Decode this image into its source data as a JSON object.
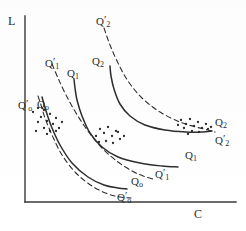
{
  "figure": {
    "axes": {
      "y_label": "L",
      "x_label": "C",
      "origin": [
        25,
        202
      ],
      "y_top": 16,
      "x_right": 236
    },
    "labels": [
      {
        "id": "q2-prime-top",
        "base": "Q",
        "sub": "2",
        "prime": true,
        "x": 96,
        "y": 14
      },
      {
        "id": "q1-prime-left",
        "base": "Q",
        "sub": "1",
        "prime": true,
        "x": 45,
        "y": 56
      },
      {
        "id": "q1-left",
        "base": "Q",
        "sub": "1",
        "prime": false,
        "x": 67,
        "y": 68
      },
      {
        "id": "q2-left",
        "base": "Q",
        "sub": "2",
        "prime": false,
        "x": 92,
        "y": 56
      },
      {
        "id": "q0-prime-axis",
        "base": "Q",
        "sub": "o",
        "prime": true,
        "x": 18,
        "y": 98
      },
      {
        "id": "q0-axis",
        "base": "Q",
        "sub": "o",
        "prime": false,
        "x": 37,
        "y": 99
      },
      {
        "id": "q2-right",
        "base": "Q",
        "sub": "2",
        "prime": false,
        "x": 215,
        "y": 117
      },
      {
        "id": "q2-prime-right",
        "base": "Q",
        "sub": "2",
        "prime": true,
        "x": 215,
        "y": 133
      },
      {
        "id": "q1-right",
        "base": "Q",
        "sub": "1",
        "prime": false,
        "x": 185,
        "y": 150
      },
      {
        "id": "q1-prime-right",
        "base": "Q",
        "sub": "1",
        "prime": true,
        "x": 155,
        "y": 167
      },
      {
        "id": "q0-right",
        "base": "Q",
        "sub": "o",
        "prime": false,
        "x": 131,
        "y": 176
      },
      {
        "id": "q0-prime-bottom",
        "base": "Q",
        "sub": "o",
        "prime": true,
        "x": 117,
        "y": 190
      }
    ]
  },
  "chart_data": {
    "type": "line",
    "title": "",
    "xlabel": "C",
    "ylabel": "L",
    "grid": false,
    "legend": "none",
    "note": "Family of convex downward-sloping iso-curves; solid = Q-curves, dashed = Q-prime curves; scattered dots are observed data points.",
    "series": [
      {
        "name": "Qo",
        "style": "solid",
        "points": [
          [
            42,
            97
          ],
          [
            44,
            104
          ],
          [
            47,
            114
          ],
          [
            52,
            128
          ],
          [
            60,
            145
          ],
          [
            72,
            163
          ],
          [
            88,
            177
          ],
          [
            104,
            185
          ],
          [
            118,
            188
          ],
          [
            127,
            189
          ]
        ]
      },
      {
        "name": "Qo'",
        "style": "dashed",
        "points": [
          [
            38,
            96
          ],
          [
            41,
            105
          ],
          [
            45,
            118
          ],
          [
            52,
            135
          ],
          [
            62,
            155
          ],
          [
            76,
            173
          ],
          [
            92,
            186
          ],
          [
            108,
            194
          ],
          [
            120,
            197
          ],
          [
            131,
            198
          ]
        ]
      },
      {
        "name": "Q1",
        "style": "solid",
        "points": [
          [
            74,
            79
          ],
          [
            75,
            88
          ],
          [
            77,
            100
          ],
          [
            82,
            116
          ],
          [
            90,
            133
          ],
          [
            102,
            147
          ],
          [
            118,
            157
          ],
          [
            140,
            163
          ],
          [
            162,
            166
          ],
          [
            178,
            167
          ]
        ]
      },
      {
        "name": "Q1'",
        "style": "dashed",
        "points": [
          [
            52,
            64
          ],
          [
            58,
            78
          ],
          [
            66,
            95
          ],
          [
            76,
            113
          ],
          [
            88,
            131
          ],
          [
            102,
            148
          ],
          [
            118,
            162
          ],
          [
            134,
            172
          ],
          [
            146,
            177
          ],
          [
            153,
            179
          ]
        ]
      },
      {
        "name": "Q2",
        "style": "solid",
        "points": [
          [
            110,
            66
          ],
          [
            111,
            76
          ],
          [
            114,
            89
          ],
          [
            120,
            104
          ],
          [
            130,
            116
          ],
          [
            145,
            125
          ],
          [
            165,
            130
          ],
          [
            186,
            132
          ],
          [
            202,
            132
          ],
          [
            212,
            131
          ]
        ]
      },
      {
        "name": "Q2'",
        "style": "dashed",
        "points": [
          [
            104,
            28
          ],
          [
            110,
            45
          ],
          [
            118,
            63
          ],
          [
            128,
            81
          ],
          [
            142,
            98
          ],
          [
            160,
            112
          ],
          [
            180,
            122
          ],
          [
            196,
            127
          ],
          [
            208,
            130
          ],
          [
            215,
            132
          ]
        ]
      }
    ],
    "scatter": {
      "name": "observations",
      "points": [
        [
          33,
          112
        ],
        [
          38,
          108
        ],
        [
          41,
          117
        ],
        [
          44,
          110
        ],
        [
          47,
          121
        ],
        [
          50,
          114
        ],
        [
          53,
          124
        ],
        [
          56,
          118
        ],
        [
          59,
          128
        ],
        [
          44,
          128
        ],
        [
          50,
          131
        ],
        [
          38,
          122
        ],
        [
          56,
          131
        ],
        [
          62,
          122
        ],
        [
          36,
          131
        ],
        [
          47,
          134
        ],
        [
          100,
          129
        ],
        [
          104,
          133
        ],
        [
          108,
          127
        ],
        [
          112,
          136
        ],
        [
          116,
          131
        ],
        [
          120,
          139
        ],
        [
          96,
          136
        ],
        [
          106,
          141
        ],
        [
          113,
          143
        ],
        [
          99,
          142
        ],
        [
          118,
          132
        ],
        [
          124,
          136
        ],
        [
          181,
          120
        ],
        [
          186,
          124
        ],
        [
          190,
          119
        ],
        [
          194,
          126
        ],
        [
          198,
          122
        ],
        [
          202,
          128
        ],
        [
          206,
          124
        ],
        [
          184,
          128
        ],
        [
          192,
          131
        ],
        [
          199,
          132
        ],
        [
          208,
          129
        ],
        [
          178,
          125
        ],
        [
          211,
          127
        ],
        [
          188,
          134
        ]
      ]
    }
  }
}
